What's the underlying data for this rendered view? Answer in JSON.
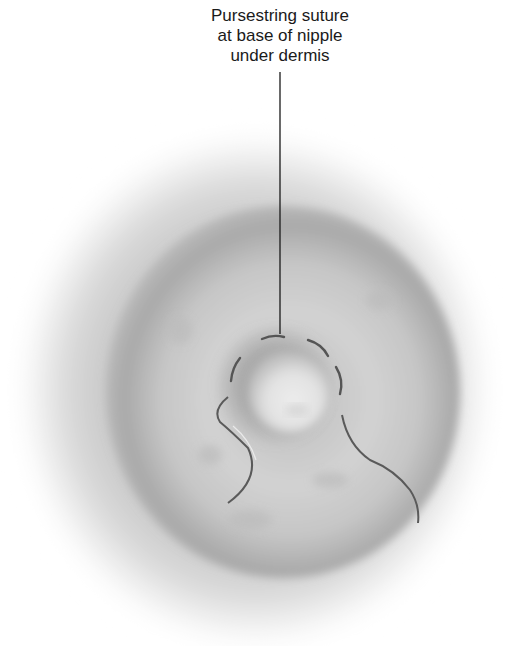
{
  "figure": {
    "label_lines": [
      "Pursestring suture",
      "at base of nipple",
      "under dermis"
    ],
    "label_full": "Pursestring suture at base of nipple under dermis",
    "colors": {
      "background": "#ffffff",
      "skin_halo": "#c9c9c9",
      "areola": "#a9a9a9",
      "areola_light": "#cfcfcf",
      "nipple": "#e8e8e8",
      "suture": "#555555",
      "leader_line": "#1a1a1a"
    }
  }
}
